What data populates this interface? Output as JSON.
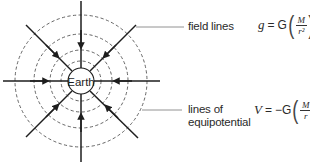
{
  "diagram": {
    "center_label": "Earth",
    "labels": {
      "field_lines": "field lines",
      "equipotential_line1": "lines of",
      "equipotential_line2": "equipotential"
    },
    "equations": {
      "field": {
        "lhs": "g",
        "equals": "=",
        "const": "G",
        "numerator": "M",
        "denominator": "r²",
        "open_paren": "(",
        "close_paren": ")"
      },
      "potential": {
        "lhs": "V",
        "equals": "=",
        "const": "−G",
        "numerator": "M",
        "denominator": "r",
        "open_paren": "(",
        "close_paren": ")"
      }
    },
    "geometry": {
      "center": [
        81,
        81
      ],
      "earth_radius": 13,
      "equipotential_radii": [
        20,
        31,
        47,
        66
      ],
      "field_line_count": 8
    },
    "colors": {
      "line": "#1e1e1e",
      "dashed": "#555555",
      "text": "#2a2a2a"
    }
  }
}
